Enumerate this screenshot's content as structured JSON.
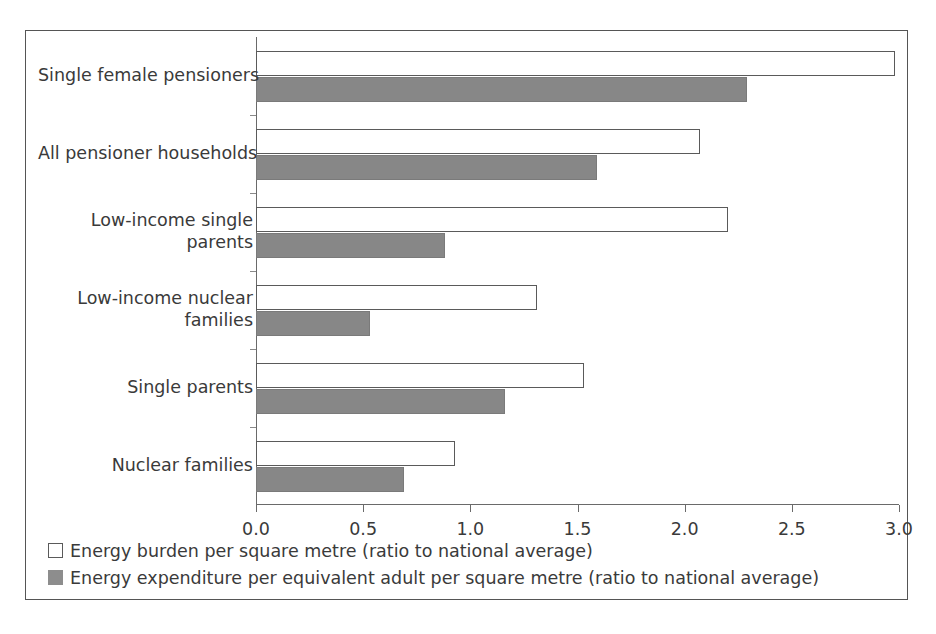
{
  "chart_data": {
    "type": "bar",
    "orientation": "horizontal",
    "title": "",
    "xlabel": "",
    "ylabel": "",
    "xlim": [
      0.0,
      3.0
    ],
    "xticks": [
      "0.0",
      "0.5",
      "1.0",
      "1.5",
      "2.0",
      "2.5",
      "3.0"
    ],
    "xtick_values": [
      0.0,
      0.5,
      1.0,
      1.5,
      2.0,
      2.5,
      3.0
    ],
    "grid": false,
    "legend_position": "bottom-left",
    "categories": [
      "Single female pensioners",
      "All pensioner households",
      "Low-income single parents",
      "Low-income nuclear families",
      "Single parents",
      "Nuclear families"
    ],
    "series": [
      {
        "name": "Energy burden per square metre (ratio to national average)",
        "color": "#ffffff",
        "edge_color": "#5a5a5a",
        "values": [
          2.98,
          2.07,
          2.2,
          1.31,
          1.53,
          0.93
        ]
      },
      {
        "name": "Energy expenditure per equivalent adult per square metre (ratio to national average)",
        "color": "#878787",
        "edge_color": "#7a7a7a",
        "values": [
          2.29,
          1.59,
          0.88,
          0.53,
          1.16,
          0.69
        ]
      }
    ]
  },
  "legend": {
    "items": [
      {
        "swatch": "burden",
        "label": "Energy burden per square metre (ratio to national average)"
      },
      {
        "swatch": "expenditure",
        "label": "Energy expenditure per equivalent adult per square metre (ratio to national average)"
      }
    ]
  }
}
